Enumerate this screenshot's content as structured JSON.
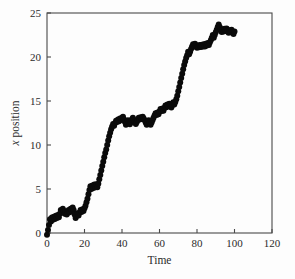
{
  "figure": {
    "background_color": "#fdfdfd",
    "plot_area": {
      "left": 47,
      "top": 13,
      "right": 272,
      "bottom": 233
    }
  },
  "chart_data": {
    "type": "scatter",
    "title": "",
    "subtitle": "",
    "xlabel": "Time",
    "ylabel": "x position",
    "ylabel_italic_prefix": "x",
    "ylabel_rest": " position",
    "xlim": [
      0,
      120
    ],
    "ylim": [
      0,
      25
    ],
    "xticks": [
      0,
      20,
      40,
      60,
      80,
      100,
      120
    ],
    "yticks": [
      0,
      5,
      10,
      15,
      20,
      25
    ],
    "xtick_labels": [
      "0",
      "20",
      "40",
      "60",
      "80",
      "100",
      "120"
    ],
    "ytick_labels": [
      "0",
      "5",
      "10",
      "15",
      "20",
      "25"
    ],
    "grid": false,
    "legend": null,
    "marker": {
      "shape": "circle",
      "color": "#0a0a0a",
      "size_px": 4.0
    },
    "series": [
      {
        "name": "x position",
        "color": "#0a0a0a",
        "x": [
          0.0,
          0.53,
          1.05,
          1.58,
          2.11,
          2.63,
          3.16,
          3.68,
          4.21,
          4.74,
          5.26,
          5.79,
          6.32,
          6.84,
          7.37,
          7.89,
          8.42,
          8.95,
          9.47,
          10.0,
          10.53,
          11.05,
          11.58,
          12.11,
          12.63,
          13.16,
          13.68,
          14.21,
          14.74,
          15.26,
          15.79,
          16.32,
          16.84,
          17.37,
          17.89,
          18.42,
          18.95,
          19.47,
          20.0,
          20.53,
          21.05,
          21.58,
          22.11,
          22.63,
          23.16,
          23.68,
          24.21,
          24.74,
          25.26,
          25.79,
          26.32,
          26.84,
          27.37,
          27.89,
          28.42,
          28.95,
          29.47,
          30.0,
          30.53,
          31.05,
          31.58,
          32.11,
          32.63,
          33.16,
          33.68,
          34.21,
          34.74,
          35.26,
          35.79,
          36.32,
          36.84,
          37.37,
          37.89,
          38.42,
          38.95,
          39.47,
          40.0,
          40.53,
          41.05,
          41.58,
          42.11,
          42.63,
          43.16,
          43.68,
          44.21,
          44.74,
          45.26,
          45.79,
          46.32,
          46.84,
          47.37,
          47.89,
          48.42,
          48.95,
          49.47,
          50.0,
          50.53,
          51.05,
          51.58,
          52.11,
          52.63,
          53.16,
          53.68,
          54.21,
          54.74,
          55.26,
          55.79,
          56.32,
          56.84,
          57.37,
          57.89,
          58.42,
          58.95,
          59.47,
          60.0,
          60.53,
          61.05,
          61.58,
          62.11,
          62.63,
          63.16,
          63.68,
          64.21,
          64.74,
          65.26,
          65.79,
          66.32,
          66.84,
          67.37,
          67.89,
          68.42,
          68.95,
          69.47,
          70.0,
          70.53,
          71.05,
          71.58,
          72.11,
          72.63,
          73.16,
          73.68,
          74.21,
          74.74,
          75.26,
          75.79,
          76.32,
          76.84,
          77.37,
          77.89,
          78.42,
          78.95,
          79.47,
          80.0,
          80.53,
          81.05,
          81.58,
          82.11,
          82.63,
          83.16,
          83.68,
          84.21,
          84.74,
          85.26,
          85.79,
          86.32,
          86.84,
          87.37,
          87.89,
          88.42,
          88.95,
          89.47,
          90.0,
          90.53,
          91.05,
          91.58,
          92.11,
          92.63,
          93.16,
          93.68,
          94.21,
          94.74,
          95.26,
          95.79,
          96.32,
          96.84,
          97.37,
          97.89,
          98.42,
          98.95,
          99.47,
          100.0
        ],
        "y": [
          -0.2,
          0.35,
          0.9,
          1.55,
          1.3,
          1.75,
          1.5,
          1.85,
          1.6,
          1.95,
          1.7,
          2.05,
          1.8,
          2.2,
          2.6,
          2.4,
          2.75,
          2.5,
          2.2,
          2.45,
          2.1,
          2.3,
          2.6,
          2.35,
          2.75,
          2.55,
          2.9,
          2.6,
          2.1,
          1.7,
          1.95,
          2.25,
          2.0,
          2.3,
          2.6,
          2.4,
          2.7,
          2.5,
          2.8,
          3.1,
          3.5,
          3.9,
          4.4,
          4.9,
          5.3,
          5.0,
          5.4,
          5.1,
          5.5,
          5.2,
          5.55,
          5.2,
          5.6,
          6.1,
          6.6,
          7.1,
          7.6,
          8.1,
          8.6,
          9.1,
          9.5,
          10.0,
          10.5,
          11.0,
          11.4,
          11.8,
          12.1,
          12.4,
          12.2,
          12.5,
          12.75,
          12.6,
          12.9,
          12.7,
          13.0,
          12.85,
          13.1,
          13.2,
          12.9,
          12.6,
          12.3,
          12.55,
          12.8,
          12.6,
          12.35,
          12.6,
          12.9,
          13.1,
          12.85,
          12.6,
          12.4,
          12.6,
          12.85,
          13.1,
          12.9,
          13.15,
          12.95,
          13.2,
          13.0,
          12.8,
          12.55,
          12.3,
          12.55,
          12.8,
          12.5,
          12.3,
          12.55,
          12.85,
          13.1,
          13.35,
          13.6,
          13.4,
          13.7,
          13.5,
          13.8,
          14.1,
          13.85,
          14.15,
          13.9,
          14.2,
          14.5,
          14.3,
          14.6,
          14.4,
          14.7,
          14.5,
          14.25,
          14.55,
          14.85,
          14.6,
          14.9,
          15.2,
          15.6,
          16.1,
          16.6,
          17.1,
          17.6,
          18.1,
          18.6,
          19.1,
          19.5,
          19.9,
          20.2,
          20.6,
          20.3,
          20.6,
          20.9,
          21.2,
          21.45,
          21.2,
          21.5,
          21.25,
          21.05,
          21.3,
          21.1,
          21.35,
          21.15,
          21.4,
          21.2,
          21.45,
          21.2,
          21.5,
          21.3,
          21.6,
          21.35,
          21.65,
          21.9,
          22.2,
          22.5,
          22.2,
          22.5,
          22.8,
          23.1,
          23.4,
          23.7,
          23.4,
          23.1,
          22.85,
          23.15,
          22.9,
          23.2,
          22.95,
          23.25,
          23.0,
          22.75,
          23.05,
          22.8,
          23.1,
          22.85,
          22.6,
          22.9
        ]
      }
    ]
  }
}
